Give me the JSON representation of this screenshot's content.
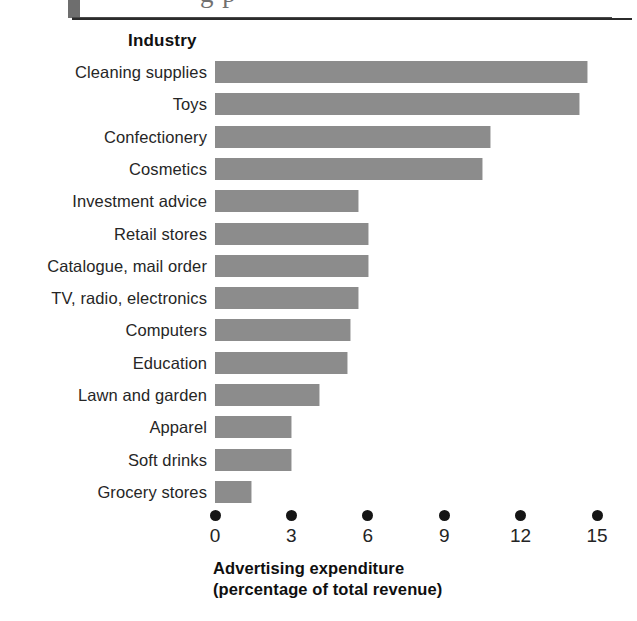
{
  "page": {
    "header_partial_text": "g p",
    "heading": "Industry"
  },
  "chart_data": {
    "type": "bar",
    "orientation": "horizontal",
    "title": "",
    "category_axis_title": "Industry",
    "xlabel": "Advertising expenditure (percentage of total revenue)",
    "xlabel_line1": "Advertising expenditure",
    "xlabel_line2": "(percentage of total revenue)",
    "ylabel": "",
    "xlim": [
      0,
      15
    ],
    "xticks": [
      0,
      3,
      6,
      9,
      12,
      15
    ],
    "xtick_labels": [
      "0",
      "3",
      "6",
      "9",
      "12",
      "15"
    ],
    "grid": false,
    "legend": "none",
    "bar_color": "#8c8c8c",
    "categories": [
      "Cleaning supplies",
      "Toys",
      "Confectionery",
      "Cosmetics",
      "Investment advice",
      "Retail stores",
      "Catalogue, mail order",
      "TV, radio, electronics",
      "Computers",
      "Education",
      "Lawn and garden",
      "Apparel",
      "Soft drinks",
      "Grocery stores"
    ],
    "values": [
      14.6,
      14.3,
      10.8,
      10.5,
      5.6,
      6.0,
      6.0,
      5.6,
      5.3,
      5.2,
      4.1,
      3.0,
      3.0,
      1.4
    ]
  }
}
